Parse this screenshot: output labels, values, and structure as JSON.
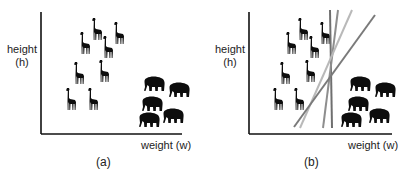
{
  "panels": [
    {
      "id": "a",
      "caption": "(a)",
      "y_label_line1": "height",
      "y_label_line2": "(h)",
      "x_label": "weight (w)",
      "giraffes": [
        [
          92,
          18
        ],
        [
          114,
          22
        ],
        [
          80,
          32
        ],
        [
          103,
          36
        ],
        [
          74,
          62
        ],
        [
          99,
          60
        ],
        [
          66,
          88
        ],
        [
          88,
          88
        ]
      ],
      "elephants": [
        [
          143,
          76
        ],
        [
          168,
          82
        ],
        [
          141,
          96
        ],
        [
          162,
          108
        ],
        [
          138,
          112
        ]
      ],
      "lines": []
    },
    {
      "id": "b",
      "caption": "(b)",
      "y_label_line1": "height",
      "y_label_line2": "(h)",
      "x_label": "weight (w)",
      "giraffes": [
        [
          298,
          18
        ],
        [
          320,
          22
        ],
        [
          286,
          32
        ],
        [
          309,
          36
        ],
        [
          280,
          62
        ],
        [
          305,
          60
        ],
        [
          273,
          88
        ],
        [
          294,
          88
        ]
      ],
      "elephants": [
        [
          349,
          76
        ],
        [
          374,
          82
        ],
        [
          347,
          96
        ],
        [
          368,
          108
        ],
        [
          340,
          112
        ]
      ],
      "lines": [
        {
          "x1": 330,
          "y1": 10,
          "x2": 332,
          "y2": 128,
          "color": "#6f6f6f"
        },
        {
          "x1": 338,
          "y1": 10,
          "x2": 323,
          "y2": 128,
          "color": "#8e8e8e"
        },
        {
          "x1": 352,
          "y1": 10,
          "x2": 300,
          "y2": 128,
          "color": "#b9b9b9"
        },
        {
          "x1": 375,
          "y1": 15,
          "x2": 294,
          "y2": 127,
          "color": "#7a7a7a"
        }
      ]
    }
  ],
  "colors": {
    "axis": "#111111",
    "animal": "#0d0d0d"
  }
}
